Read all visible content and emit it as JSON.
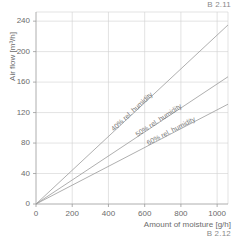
{
  "corner": {
    "top_right": "B 2.11",
    "bottom_right": "B 2.12"
  },
  "chart_data": {
    "type": "line",
    "title": "",
    "subtitle": "",
    "xlabel": "Amount of moisture [g/h]",
    "ylabel": "Air flow [m³/h]",
    "xlim": [
      0,
      1060
    ],
    "ylim": [
      0,
      252
    ],
    "xticks": [
      0,
      200,
      400,
      600,
      800,
      1000
    ],
    "xtick_labels": [
      "0",
      "200",
      "400",
      "600",
      "800",
      "1000"
    ],
    "yticks": [
      0,
      40,
      80,
      120,
      160,
      200,
      240
    ],
    "ytick_labels": [
      "0",
      "40",
      "80",
      "120",
      "160",
      "200",
      "240"
    ],
    "grid": true,
    "grid_color": "#d0d0d0",
    "axis_color": "#9a9a9a",
    "line_color": "#9a9a9a",
    "legend": "inline-rotated-labels",
    "legend_position": "along-lines",
    "series": [
      {
        "name": "40% rel. humidity",
        "label": "40% rel. humidity",
        "slope": 0.2217,
        "x": [
          0,
          1060
        ],
        "values": [
          0,
          235
        ],
        "label_x": 430,
        "label_y": 95
      },
      {
        "name": "50% rel. humidity",
        "label": "50% rel. humidity",
        "slope": 0.1575,
        "x": [
          0,
          1060
        ],
        "values": [
          0,
          167
        ],
        "label_x": 560,
        "label_y": 88
      },
      {
        "name": "60% rel. humidity",
        "label": "60% rel. humidity",
        "slope": 0.1236,
        "x": [
          0,
          1060
        ],
        "values": [
          0,
          131
        ],
        "label_x": 620,
        "label_y": 77
      }
    ]
  }
}
